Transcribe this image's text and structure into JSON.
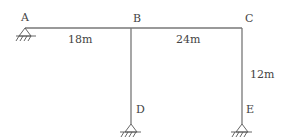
{
  "diagram": {
    "type": "structural-frame",
    "nodes": [
      {
        "id": "A",
        "label": "A",
        "support": "pin"
      },
      {
        "id": "B",
        "label": "B",
        "support": "none"
      },
      {
        "id": "C",
        "label": "C",
        "support": "none"
      },
      {
        "id": "D",
        "label": "D",
        "support": "pin"
      },
      {
        "id": "E",
        "label": "E",
        "support": "pin"
      }
    ],
    "members": [
      {
        "from": "A",
        "to": "B",
        "length_label": "18m"
      },
      {
        "from": "B",
        "to": "C",
        "length_label": "24m"
      },
      {
        "from": "B",
        "to": "D"
      },
      {
        "from": "C",
        "to": "E",
        "length_label": "12m"
      }
    ],
    "colors": {
      "line": "#777777",
      "text": "#444444",
      "background": "#ffffff"
    }
  }
}
